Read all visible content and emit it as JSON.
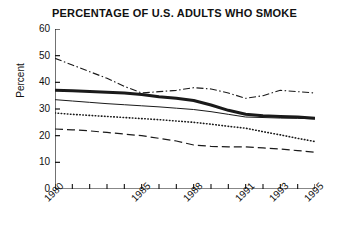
{
  "chart_data": {
    "type": "line",
    "title": "PERCENTAGE OF U.S. ADULTS WHO SMOKE",
    "xlabel": "",
    "ylabel": "Percent",
    "ylim": [
      0,
      60
    ],
    "yticks": [
      0,
      10,
      20,
      30,
      40,
      50,
      60
    ],
    "xlim": [
      1980,
      1995
    ],
    "x": [
      1980,
      1981,
      1982,
      1983,
      1984,
      1985,
      1986,
      1987,
      1988,
      1989,
      1990,
      1991,
      1992,
      1993,
      1994,
      1995
    ],
    "xticks": [
      1980,
      1981,
      1982,
      1983,
      1984,
      1985,
      1986,
      1987,
      1988,
      1989,
      1990,
      1991,
      1992,
      1993,
      1994,
      1995
    ],
    "xtick_labels": [
      "1980",
      "1985",
      "1988",
      "1991",
      "1993",
      "1995"
    ],
    "xtick_label_years": [
      1980,
      1985,
      1988,
      1991,
      1993,
      1995
    ],
    "grid": false,
    "legend": "none",
    "series": [
      {
        "name": "dash-dot-series",
        "style": "dash-dot",
        "values": [
          49,
          46.5,
          44,
          41.5,
          38.5,
          36,
          36.5,
          37,
          38,
          37.5,
          36,
          34,
          35,
          37,
          36.5,
          36
        ]
      },
      {
        "name": "thick-solid-series",
        "style": "thick-solid",
        "values": [
          37,
          36.8,
          36.6,
          36.3,
          36,
          35.4,
          34.6,
          34,
          33.2,
          31.5,
          29.5,
          28,
          27.5,
          27.2,
          27,
          26.5
        ]
      },
      {
        "name": "thin-solid-series",
        "style": "thin-solid",
        "values": [
          33.5,
          33,
          32.5,
          32,
          31.6,
          31.2,
          30.8,
          30.3,
          29.8,
          29,
          28,
          27,
          26.8,
          26.6,
          26.5,
          26.3
        ]
      },
      {
        "name": "dotted-series",
        "style": "dotted",
        "values": [
          28.5,
          28,
          27.6,
          27.2,
          26.8,
          26.4,
          26,
          25.5,
          25,
          24.3,
          23.5,
          22.8,
          21.5,
          20.3,
          19,
          17.8
        ]
      },
      {
        "name": "dashed-series",
        "style": "dashed",
        "values": [
          22.5,
          22.2,
          21.8,
          21.2,
          20.6,
          20,
          19,
          18,
          16.5,
          16,
          15.8,
          15.8,
          15.4,
          15,
          14.4,
          13.8
        ]
      }
    ]
  }
}
